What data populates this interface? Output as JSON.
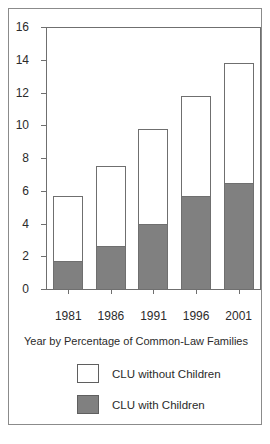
{
  "chart_data": {
    "type": "bar",
    "subtype": "stacked-bar",
    "title": "",
    "xlabel": "Year by Percentage of Common-Law Families",
    "ylabel": "",
    "categories": [
      "1981",
      "1986",
      "1991",
      "1996",
      "2001"
    ],
    "ylim": [
      0,
      16
    ],
    "yticks": [
      0,
      2,
      4,
      6,
      8,
      10,
      12,
      14,
      16
    ],
    "ytick_labels": [
      "0",
      "2",
      "4",
      "6",
      "8",
      "10",
      "12",
      "14",
      "16"
    ],
    "grid": false,
    "legend_position": "bottom",
    "series": [
      {
        "name": "CLU with Children",
        "color": "#808080",
        "values": [
          1.7,
          2.6,
          4.0,
          5.7,
          6.5
        ]
      },
      {
        "name": "CLU without Children",
        "color": "#ffffff",
        "values": [
          4.0,
          4.9,
          5.8,
          6.1,
          7.3
        ]
      }
    ],
    "totals": [
      5.7,
      7.5,
      9.8,
      11.8,
      13.8
    ]
  },
  "axis": {
    "caption": "Year by Percentage of Common-Law Families"
  },
  "legend": {
    "items": [
      {
        "label": "CLU without Children",
        "swatch": "white"
      },
      {
        "label": "CLU with Children",
        "swatch": "gray"
      }
    ]
  },
  "colors": {
    "with_children_fill": "#808080",
    "without_children_fill": "#ffffff",
    "axis_line": "#6f6f6f",
    "frame_border": "#8b8b8b",
    "text": "#2b2b2b"
  }
}
